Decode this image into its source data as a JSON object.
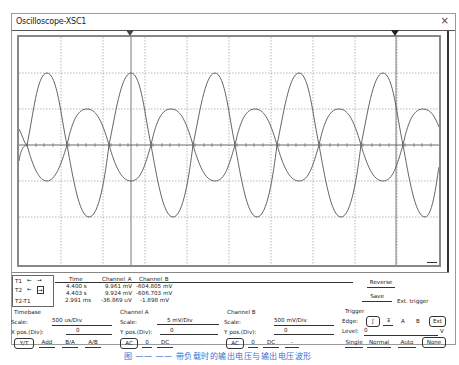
{
  "window": {
    "title": "Oscilloscope-XSC1",
    "close_glyph": "×"
  },
  "cursors": {
    "t1_label": "T1",
    "t2_label": "T2",
    "diff_label": "T2-T1",
    "arrow_left": "←",
    "arrow_right": "→"
  },
  "readout": {
    "headers": [
      "Time",
      "Channel_A",
      "Channel_B"
    ],
    "rows": [
      {
        "time": "4.400 s",
        "a": "9.961 mV",
        "b": "-604.805 mV"
      },
      {
        "time": "4.403 s",
        "a": "9.924 mV",
        "b": "-606.703 mV"
      },
      {
        "time": "2.991 ms",
        "a": "-36.869 uV",
        "b": "-1.898 mV"
      }
    ]
  },
  "actions": {
    "reverse": "Reverse",
    "save": "Save",
    "ext_trigger": "Ext. trigger"
  },
  "timebase": {
    "title": "Timebase",
    "scale_label": "Scale:",
    "scale_value": "500 us/Div",
    "xpos_label": "X pos.(Div):",
    "xpos_value": "0",
    "modes": [
      "Y/T",
      "Add",
      "B/A",
      "A/B"
    ],
    "selected_mode": "Y/T"
  },
  "channel_a": {
    "title": "Channel A",
    "scale_label": "Scale:",
    "scale_value": "5 mV/Div",
    "ypos_label": "Y pos.(Div):",
    "ypos_value": "0",
    "coupling": [
      "AC",
      "0",
      "DC"
    ],
    "selected_coupling": "AC"
  },
  "channel_b": {
    "title": "Channel B",
    "scale_label": "Scale:",
    "scale_value": "500 mV/Div",
    "ypos_label": "Y pos.(Div):",
    "ypos_value": "0",
    "coupling": [
      "AC",
      "0",
      "DC",
      "-"
    ],
    "selected_coupling": "AC"
  },
  "trigger": {
    "title": "Trigger",
    "edge_label": "Edge:",
    "edge_rise": "ʃ",
    "edge_fall": "Ⳣ",
    "source_a": "A",
    "source_b": "B",
    "source_ext": "Ext",
    "level_label": "Level:",
    "level_value": "0",
    "level_unit": "V",
    "modes": [
      "Single",
      "Normal",
      "Auto",
      "None"
    ],
    "selected_mode": "None"
  },
  "caption": "图 ——  ——  带负载时的输出电压与输出电压波形",
  "colors": {
    "trace": "#555555",
    "grid": "#777777",
    "caption": "#3b6fd1"
  }
}
